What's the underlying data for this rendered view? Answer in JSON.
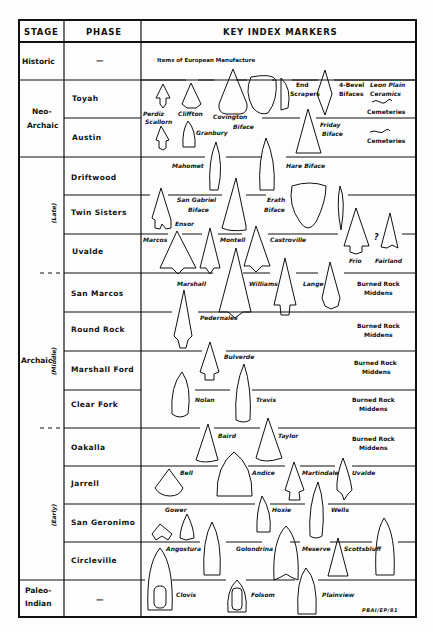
{
  "header": {
    "stage": "STAGE",
    "phase": "PHASE",
    "markers": "KEY INDEX MARKERS"
  },
  "stages": {
    "historic": "Historic",
    "neo_archaic_1": "Neo-",
    "neo_archaic_2": "Archaic",
    "archaic": "Archaic",
    "paleo_1": "Paleo-",
    "paleo_2": "Indian"
  },
  "sub_periods": {
    "late": "(Late)",
    "middle": "(Middle)",
    "early": "(Early)"
  },
  "phases": {
    "historic": "—",
    "toyah": "Toyah",
    "austin": "Austin",
    "driftwood": "Driftwood",
    "twin_sisters": "Twin Sisters",
    "uvalde": "Uvalde",
    "san_marcos": "San Marcos",
    "round_rock": "Round Rock",
    "marshall_ford": "Marshall Ford",
    "clear_fork": "Clear Fork",
    "oakalla": "Oakalla",
    "jarrell": "Jarrell",
    "san_geronimo": "San Geronimo",
    "circleville": "Circleville",
    "paleo": "—"
  },
  "markers": {
    "historic_note": "Items of European Manufacture",
    "perdiz": "Perdiz",
    "cliffton": "Cliffton",
    "covington": "Covington",
    "covington_biface": "Biface",
    "end_scrapers_1": "End",
    "end_scrapers_2": "Scrapers",
    "four_bevel_1": "4-Bevel",
    "four_bevel_2": "Bifaces",
    "leon_plain_1": "Leon Plain",
    "leon_plain_2": "Ceramics",
    "cemeteries_1": "Cemeteries",
    "scallorn": "Scallorn",
    "granbury": "Granbury",
    "friday_1": "Friday",
    "friday_2": "Biface",
    "cemeteries_2": "Cemeteries",
    "mahomet": "Mahomet",
    "hare_biface": "Hare Biface",
    "san_gabriel_1": "San Gabriel",
    "san_gabriel_2": "Biface",
    "erath_1": "Erath",
    "erath_2": "Biface",
    "ensor": "Ensor",
    "marcos": "Marcos",
    "montell": "Montell",
    "castroville": "Castroville",
    "question": "?",
    "frio": "Frio",
    "fairland": "Fairland",
    "marshall": "Marshall",
    "williams": "Williams",
    "lange": "Lange",
    "brm_1a": "Burned Rock",
    "brm_1b": "Middens",
    "pedernales": "Pedernales",
    "brm_2a": "Burned Rock",
    "brm_2b": "Middens",
    "bulverde": "Bulverde",
    "brm_3a": "Burned Rock",
    "brm_3b": "Middens",
    "nolan": "Nolan",
    "travis": "Travis",
    "brm_4a": "Burned Rock",
    "brm_4b": "Middens",
    "baird": "Baird",
    "taylor": "Taylor",
    "brm_5a": "Burned Rock",
    "brm_5b": "Middens",
    "bell": "Bell",
    "andice": "Andice",
    "martindale": "Martindale",
    "uvalde_pt": "Uvalde",
    "gower": "Gower",
    "hoxie": "Hoxie",
    "wells": "Wells",
    "angostura": "Angostura",
    "golondrina": "Golondrina",
    "meserve": "Meserve",
    "scottsbluff": "Scottsbluff",
    "clovis": "Clovis",
    "folsom": "Folsom",
    "plainview": "Plainview"
  },
  "credit": "PBAI/EP/81"
}
